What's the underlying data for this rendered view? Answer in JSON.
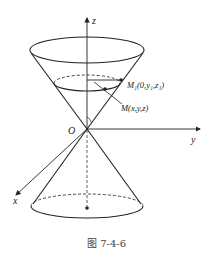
{
  "figure": {
    "caption": "图 7-4-6",
    "labels": {
      "z_axis": "z",
      "y_axis": "y",
      "x_axis": "x",
      "origin": "O",
      "point_m1": "M₁(0,y₁,z₁)",
      "point_m": "M(x,y,z)"
    }
  },
  "colors": {
    "stroke": "#222222",
    "background": "#ffffff"
  }
}
